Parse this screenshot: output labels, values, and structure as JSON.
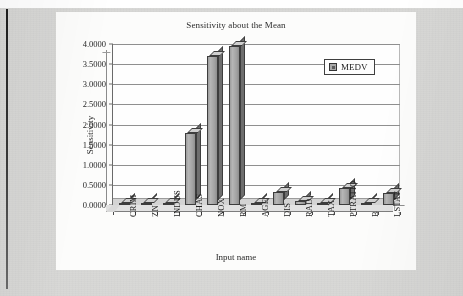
{
  "document": {
    "kind": "scanned-page",
    "background_color": "#d8d8d6",
    "card_color": "#fcfcfb"
  },
  "chart_data": {
    "type": "bar",
    "title": "Sensitivity about the Mean",
    "xlabel": "Input name",
    "ylabel": "Sensitivity",
    "categories": [
      "CRIM",
      "ZN",
      "INDUS",
      "CHAS",
      "NOX",
      "RM",
      "AGE",
      "DIS",
      "RAD",
      "TAX",
      "PTRATIO",
      "B",
      "LSTAT"
    ],
    "values": [
      0.02,
      0.02,
      0.05,
      1.78,
      3.7,
      3.95,
      0.02,
      0.33,
      0.11,
      0.02,
      0.42,
      0.02,
      0.3
    ],
    "series": [
      {
        "name": "MEDV",
        "color": "#a8a8a8",
        "values": [
          0.02,
          0.02,
          0.05,
          1.78,
          3.7,
          3.95,
          0.02,
          0.33,
          0.11,
          0.02,
          0.42,
          0.02,
          0.3
        ]
      }
    ],
    "ylim": [
      0.0,
      4.0
    ],
    "ytick_step": 0.5,
    "ytick_labels": [
      "0.0000",
      "0.5000",
      "1.0000",
      "1.5000",
      "2.0000",
      "2.5000",
      "3.0000",
      "3.5000",
      "4.0000"
    ],
    "ytick_values": [
      0.0,
      0.5,
      1.0,
      1.5,
      2.0,
      2.5,
      3.0,
      3.5,
      4.0
    ],
    "grid": true,
    "grid_axis": "y",
    "legend": {
      "position": "top-right-inside",
      "entries": [
        {
          "label": "MEDV",
          "swatch_color": "#a8a8a8"
        }
      ]
    },
    "style": "3d-column",
    "bar_color": "#a8a8a8",
    "bar_edge_color": "#3d3d3d"
  }
}
